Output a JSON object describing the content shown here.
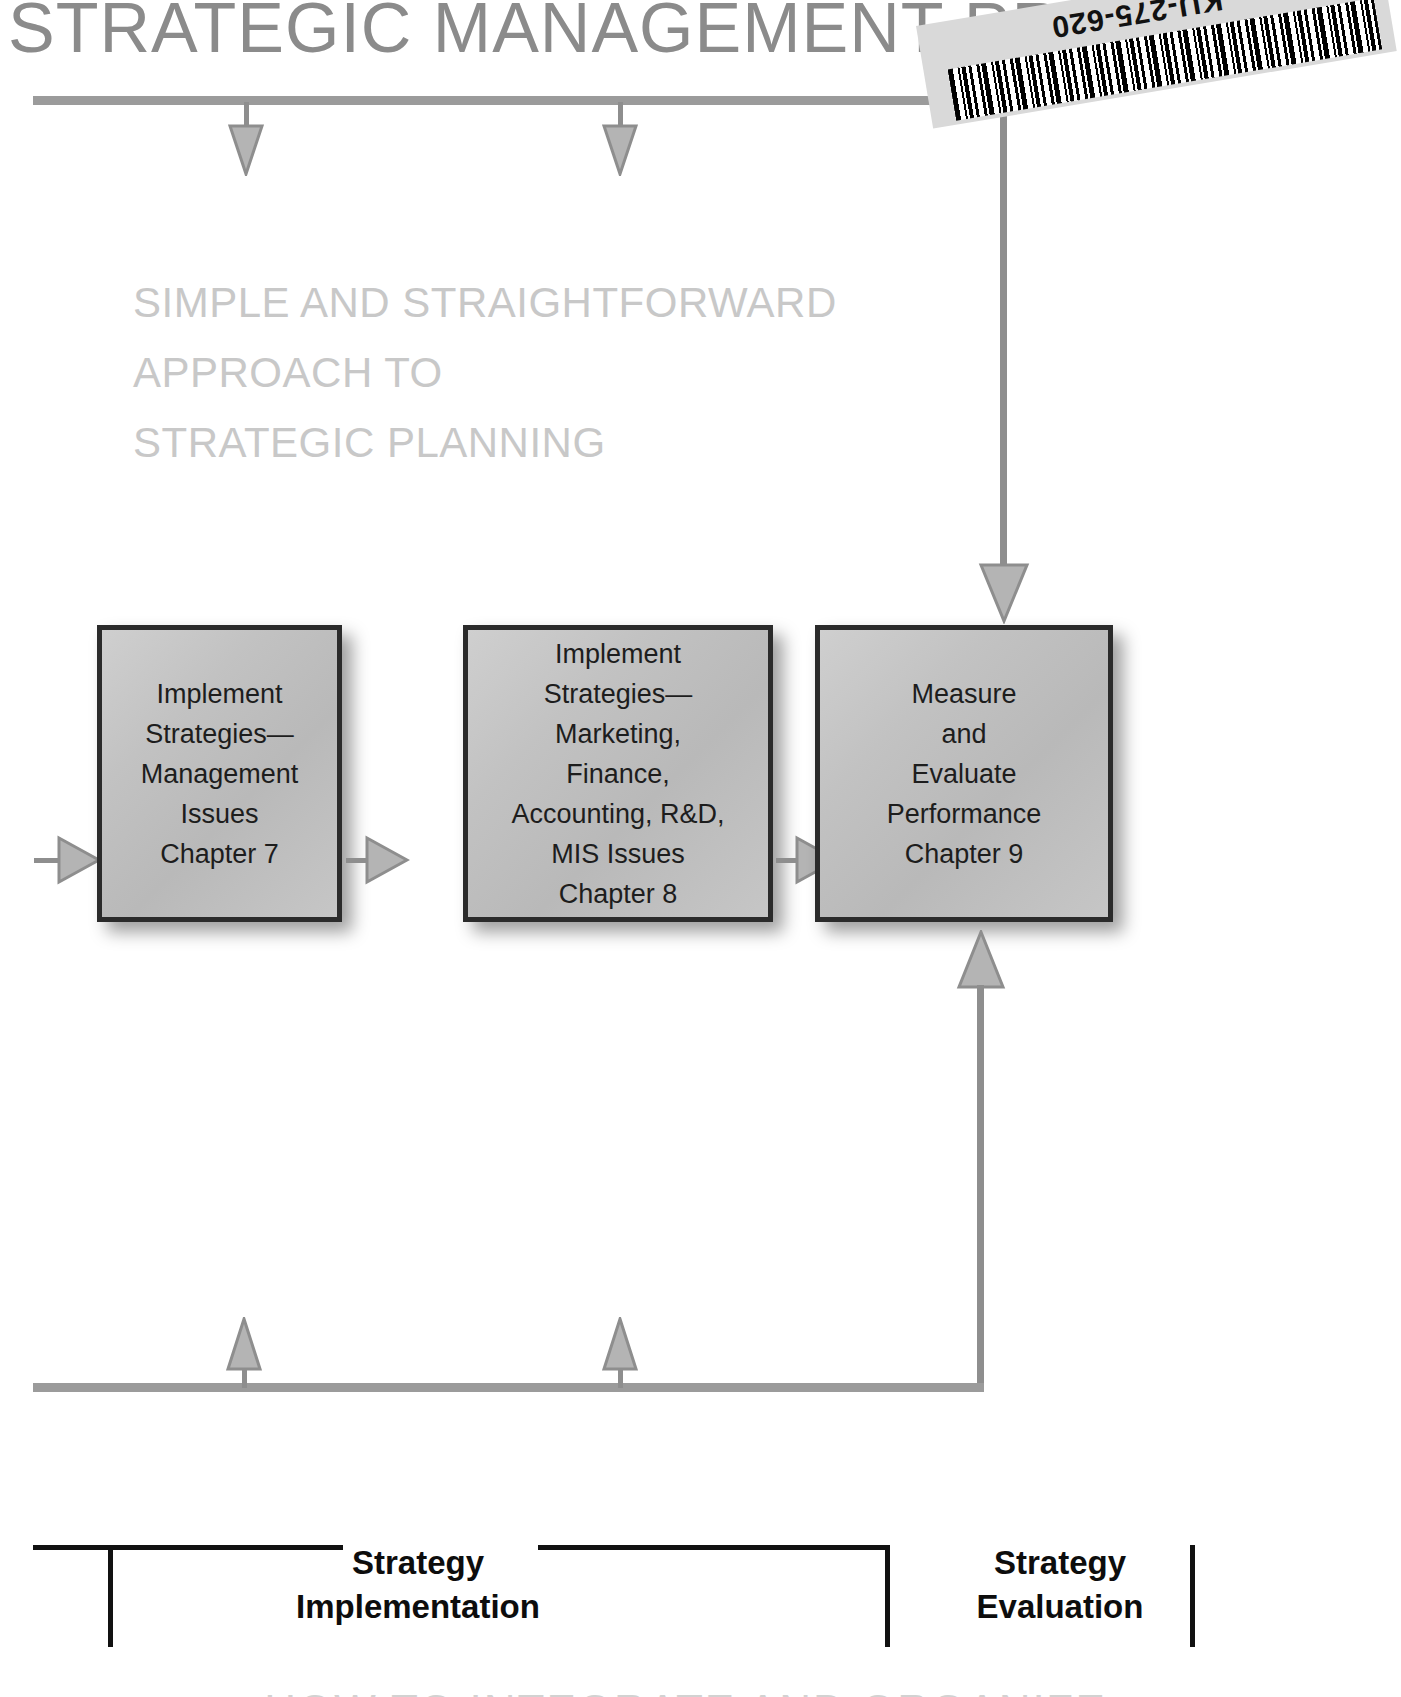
{
  "page": {
    "title": "STRATEGIC  MANAGEMENT  PROCESS",
    "subtitle_line1": "SIMPLE AND STRAIGHTFORWARD",
    "subtitle_line2": "APPROACH TO",
    "subtitle_line3": "STRATEGIC PLANNING",
    "bottom_caption": "HOW TO INTEGRATE AND ORGANIZE",
    "colors": {
      "title": "#8b8b8b",
      "subtitle": "#c8c8c8",
      "rule": "#9b9b9b",
      "arrow_fill": "#b4b4b4",
      "arrow_stroke": "#8e8e8e",
      "box_border": "#2b2b2b",
      "box_fill": "#c2c2c2",
      "label": "#0d0d0d"
    }
  },
  "sticker": {
    "label": "KU-275-620",
    "arrow_icon": "sticker-arrow-icon",
    "barcode_icon": "barcode-icon"
  },
  "boxes": [
    {
      "id": "implement-strategies-management",
      "text": "Implement\nStrategies—\nManagement\nIssues\nChapter 7",
      "chapter": "Chapter 7"
    },
    {
      "id": "implement-strategies-functional",
      "text": "Implement\nStrategies—\nMarketing,\nFinance,\nAccounting, R&D,\nMIS Issues\nChapter 8",
      "chapter": "Chapter 8"
    },
    {
      "id": "measure-evaluate-performance",
      "text": "Measure\nand\nEvaluate\nPerformance\nChapter 9",
      "chapter": "Chapter 9"
    }
  ],
  "brackets": [
    {
      "id": "strategy-implementation",
      "label": "Strategy\nImplementation"
    },
    {
      "id": "strategy-evaluation",
      "label": "Strategy\nEvaluation"
    }
  ]
}
